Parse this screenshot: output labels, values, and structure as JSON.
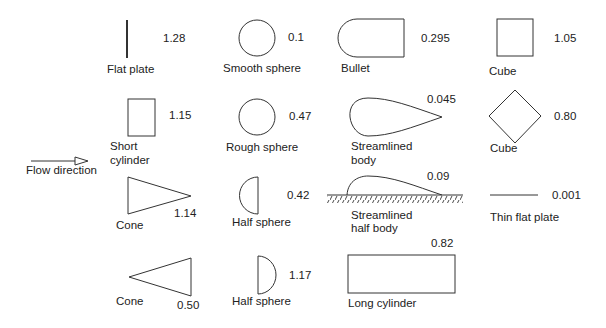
{
  "diagram": {
    "stroke_color": "#333333",
    "flow": {
      "label": "Flow direction",
      "arrow": "hollow-arrow-right"
    },
    "items": [
      {
        "id": "flat-plate",
        "label": "Flat plate",
        "value": "1.28"
      },
      {
        "id": "smooth-sphere",
        "label": "Smooth sphere",
        "value": "0.1"
      },
      {
        "id": "bullet",
        "label": "Bullet",
        "value": "0.295"
      },
      {
        "id": "cube-1",
        "label": "Cube",
        "value": "1.05"
      },
      {
        "id": "short-cylinder",
        "label": "Short cylinder",
        "label_lines": [
          "Short",
          "cylinder"
        ],
        "value": "1.15"
      },
      {
        "id": "rough-sphere",
        "label": "Rough sphere",
        "value": "0.47"
      },
      {
        "id": "streamlined-body",
        "label": "Streamlined body",
        "label_lines": [
          "Streamlined",
          "body"
        ],
        "value": "0.045"
      },
      {
        "id": "cube-2",
        "label": "Cube",
        "value": "0.80"
      },
      {
        "id": "cone-1",
        "label": "Cone",
        "value": "1.14"
      },
      {
        "id": "half-sphere-1",
        "label": "Half sphere",
        "value": "0.42"
      },
      {
        "id": "streamlined-half-body",
        "label": "Streamlined half body",
        "label_lines": [
          "Streamlined",
          "half body"
        ],
        "value": "0.09"
      },
      {
        "id": "thin-flat-plate",
        "label": "Thin flat plate",
        "value": "0.001"
      },
      {
        "id": "cone-2",
        "label": "Cone",
        "value": "0.50"
      },
      {
        "id": "half-sphere-2",
        "label": "Half sphere",
        "value": "1.17"
      },
      {
        "id": "long-cylinder",
        "label": "Long cylinder",
        "value": "0.82"
      }
    ]
  }
}
